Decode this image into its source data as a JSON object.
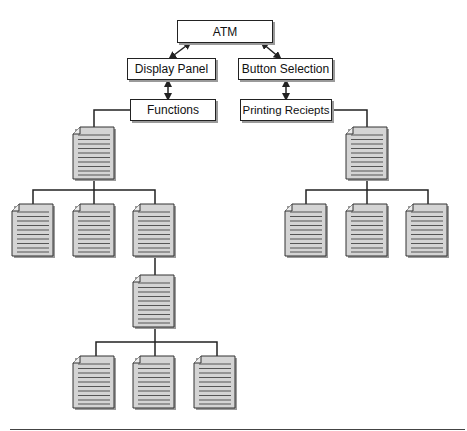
{
  "diagram": {
    "title": "ATM",
    "colors": {
      "line": "#222222",
      "doc_fill": "#d4d4d4",
      "doc_lines": "#555555",
      "box_fill": "#ffffff",
      "shadow": "#9a9a9a"
    },
    "nodes": {
      "atm": {
        "label": "ATM"
      },
      "display_panel": {
        "label": "Display Panel"
      },
      "button_selection": {
        "label": "Button Selection"
      },
      "functions": {
        "label": "Functions"
      },
      "printing_receipts": {
        "label": "Printing Reciepts"
      }
    },
    "edges": [
      {
        "from": "atm",
        "to": "display_panel",
        "type": "bidirectional-arrow"
      },
      {
        "from": "atm",
        "to": "button_selection",
        "type": "bidirectional-arrow"
      },
      {
        "from": "display_panel",
        "to": "functions",
        "type": "bidirectional-arrow"
      },
      {
        "from": "button_selection",
        "to": "printing_receipts",
        "type": "bidirectional-arrow"
      },
      {
        "from": "functions",
        "to": "doc-left-root",
        "type": "line"
      },
      {
        "from": "printing_receipts",
        "to": "doc-right-root",
        "type": "line"
      }
    ],
    "document_icons": {
      "left_tree": {
        "root": 1,
        "level1": 3,
        "level2_root": 1,
        "level3": 3
      },
      "right_tree": {
        "root": 1,
        "level1": 3
      }
    }
  }
}
